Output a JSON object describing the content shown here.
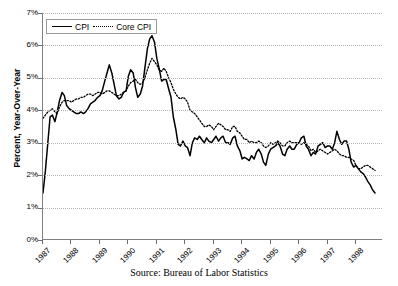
{
  "chart_data": {
    "type": "line",
    "title": "",
    "xlabel": "",
    "ylabel": "Percent, Year-Over-Year",
    "caption": "Source: Bureau of Labor Statistics",
    "ylim": [
      0,
      7
    ],
    "ytick_labels": [
      "0%",
      "1%",
      "2%",
      "3%",
      "4%",
      "5%",
      "6%",
      "7%"
    ],
    "ytick_values": [
      0,
      1,
      2,
      3,
      4,
      5,
      6,
      7
    ],
    "xtick_labels": [
      "1987",
      "1988",
      "1989",
      "1990",
      "1991",
      "1992",
      "1993",
      "1994",
      "1995",
      "1996",
      "1997",
      "1998"
    ],
    "xlim": [
      1987.0,
      1998.95
    ],
    "grid": "horizontal-dotted",
    "legend_position": "top-left-inside",
    "series": [
      {
        "name": "CPI",
        "style": "solid",
        "color": "#000000",
        "x": [
          1987.0,
          1987.08,
          1987.17,
          1987.25,
          1987.33,
          1987.42,
          1987.5,
          1987.58,
          1987.67,
          1987.75,
          1987.83,
          1987.92,
          1988.0,
          1988.08,
          1988.17,
          1988.25,
          1988.33,
          1988.42,
          1988.5,
          1988.58,
          1988.67,
          1988.75,
          1988.83,
          1988.92,
          1989.0,
          1989.08,
          1989.17,
          1989.25,
          1989.33,
          1989.42,
          1989.5,
          1989.58,
          1989.67,
          1989.75,
          1989.83,
          1989.92,
          1990.0,
          1990.08,
          1990.17,
          1990.25,
          1990.33,
          1990.42,
          1990.5,
          1990.58,
          1990.67,
          1990.75,
          1990.83,
          1990.92,
          1991.0,
          1991.08,
          1991.17,
          1991.25,
          1991.33,
          1991.42,
          1991.5,
          1991.58,
          1991.67,
          1991.75,
          1991.83,
          1991.92,
          1992.0,
          1992.08,
          1992.17,
          1992.25,
          1992.33,
          1992.42,
          1992.5,
          1992.58,
          1992.67,
          1992.75,
          1992.83,
          1992.92,
          1993.0,
          1993.08,
          1993.17,
          1993.25,
          1993.33,
          1993.42,
          1993.5,
          1993.58,
          1993.67,
          1993.75,
          1993.83,
          1993.92,
          1994.0,
          1994.08,
          1994.17,
          1994.25,
          1994.33,
          1994.42,
          1994.5,
          1994.58,
          1994.67,
          1994.75,
          1994.83,
          1994.92,
          1995.0,
          1995.08,
          1995.17,
          1995.25,
          1995.33,
          1995.42,
          1995.5,
          1995.58,
          1995.67,
          1995.75,
          1995.83,
          1995.92,
          1996.0,
          1996.08,
          1996.17,
          1996.25,
          1996.33,
          1996.42,
          1996.5,
          1996.58,
          1996.67,
          1996.75,
          1996.83,
          1996.92,
          1997.0,
          1997.08,
          1997.17,
          1997.25,
          1997.33,
          1997.42,
          1997.5,
          1997.58,
          1997.67,
          1997.75,
          1997.83,
          1997.92,
          1998.0,
          1998.08,
          1998.17,
          1998.25,
          1998.33,
          1998.42,
          1998.5,
          1998.58,
          1998.67
        ],
        "values": [
          1.45,
          2.1,
          3.0,
          3.8,
          3.85,
          3.65,
          3.95,
          4.3,
          4.55,
          4.45,
          4.15,
          4.05,
          4.0,
          3.95,
          3.9,
          3.9,
          3.95,
          3.9,
          3.95,
          4.05,
          4.2,
          4.25,
          4.3,
          4.4,
          4.45,
          4.6,
          4.9,
          5.15,
          5.4,
          5.15,
          4.8,
          4.45,
          4.35,
          4.4,
          4.55,
          4.6,
          5.05,
          5.25,
          5.15,
          4.7,
          4.4,
          4.5,
          4.75,
          5.3,
          5.9,
          6.2,
          6.3,
          6.1,
          5.6,
          5.3,
          4.9,
          4.95,
          4.95,
          4.65,
          4.4,
          3.8,
          3.4,
          2.95,
          2.9,
          3.05,
          2.9,
          2.85,
          2.6,
          3.0,
          3.15,
          3.1,
          3.2,
          3.1,
          3.0,
          3.15,
          3.05,
          3.0,
          3.1,
          3.2,
          3.05,
          3.15,
          3.2,
          3.0,
          3.0,
          2.95,
          3.15,
          3.2,
          2.9,
          2.75,
          2.5,
          2.55,
          2.5,
          2.45,
          2.6,
          2.5,
          2.7,
          2.8,
          2.65,
          2.4,
          2.3,
          2.65,
          2.8,
          2.85,
          2.9,
          3.0,
          2.9,
          2.65,
          2.6,
          2.8,
          2.9,
          2.8,
          2.8,
          2.95,
          3.0,
          3.15,
          3.2,
          2.9,
          2.8,
          2.6,
          2.7,
          2.65,
          2.9,
          2.95,
          3.0,
          2.85,
          2.9,
          2.9,
          2.8,
          3.0,
          3.35,
          3.1,
          2.95,
          3.05,
          3.05,
          2.8,
          2.4,
          2.25,
          2.3,
          2.2,
          2.1,
          2.05,
          1.95,
          1.8,
          1.7,
          1.55,
          1.45
        ]
      },
      {
        "name": "Core CPI",
        "style": "dotted",
        "color": "#000000",
        "x": [
          1987.0,
          1987.08,
          1987.17,
          1987.25,
          1987.33,
          1987.42,
          1987.5,
          1987.58,
          1987.67,
          1987.75,
          1987.83,
          1987.92,
          1988.0,
          1988.08,
          1988.17,
          1988.25,
          1988.33,
          1988.42,
          1988.5,
          1988.58,
          1988.67,
          1988.75,
          1988.83,
          1988.92,
          1989.0,
          1989.08,
          1989.17,
          1989.25,
          1989.33,
          1989.42,
          1989.5,
          1989.58,
          1989.67,
          1989.75,
          1989.83,
          1989.92,
          1990.0,
          1990.08,
          1990.17,
          1990.25,
          1990.33,
          1990.42,
          1990.5,
          1990.58,
          1990.67,
          1990.75,
          1990.83,
          1990.92,
          1991.0,
          1991.08,
          1991.17,
          1991.25,
          1991.33,
          1991.42,
          1991.5,
          1991.58,
          1991.67,
          1991.75,
          1991.83,
          1991.92,
          1992.0,
          1992.08,
          1992.17,
          1992.25,
          1992.33,
          1992.42,
          1992.5,
          1992.58,
          1992.67,
          1992.75,
          1992.83,
          1992.92,
          1993.0,
          1993.08,
          1993.17,
          1993.25,
          1993.33,
          1993.42,
          1993.5,
          1993.58,
          1993.67,
          1993.75,
          1993.83,
          1993.92,
          1994.0,
          1994.08,
          1994.17,
          1994.25,
          1994.33,
          1994.42,
          1994.5,
          1994.58,
          1994.67,
          1994.75,
          1994.83,
          1994.92,
          1995.0,
          1995.08,
          1995.17,
          1995.25,
          1995.33,
          1995.42,
          1995.5,
          1995.58,
          1995.67,
          1995.75,
          1995.83,
          1995.92,
          1996.0,
          1996.08,
          1996.17,
          1996.25,
          1996.33,
          1996.42,
          1996.5,
          1996.58,
          1996.67,
          1996.75,
          1996.83,
          1996.92,
          1997.0,
          1997.08,
          1997.17,
          1997.25,
          1997.33,
          1997.42,
          1997.5,
          1997.58,
          1997.67,
          1997.75,
          1997.83,
          1997.92,
          1998.0,
          1998.08,
          1998.17,
          1998.25,
          1998.33,
          1998.42,
          1998.5,
          1998.58,
          1998.67
        ],
        "values": [
          3.75,
          3.85,
          3.95,
          4.0,
          4.05,
          3.95,
          3.9,
          4.1,
          4.25,
          4.3,
          4.3,
          4.3,
          4.25,
          4.3,
          4.35,
          4.35,
          4.4,
          4.4,
          4.45,
          4.5,
          4.5,
          4.45,
          4.5,
          4.55,
          4.55,
          4.5,
          4.55,
          4.6,
          4.6,
          4.55,
          4.5,
          4.45,
          4.45,
          4.5,
          4.55,
          4.6,
          4.75,
          4.85,
          4.9,
          4.95,
          4.85,
          4.8,
          4.85,
          5.0,
          5.25,
          5.45,
          5.6,
          5.5,
          5.4,
          5.25,
          5.2,
          5.3,
          5.2,
          5.0,
          4.85,
          4.65,
          4.5,
          4.4,
          4.35,
          4.4,
          4.35,
          4.25,
          4.0,
          3.95,
          3.9,
          3.8,
          3.7,
          3.6,
          3.5,
          3.5,
          3.55,
          3.5,
          3.4,
          3.5,
          3.6,
          3.55,
          3.5,
          3.4,
          3.4,
          3.35,
          3.5,
          3.5,
          3.35,
          3.3,
          3.2,
          3.1,
          3.1,
          3.0,
          3.05,
          3.0,
          3.0,
          3.05,
          3.0,
          2.9,
          2.85,
          2.9,
          3.0,
          2.95,
          3.0,
          3.05,
          3.0,
          2.9,
          2.9,
          3.0,
          3.05,
          3.0,
          3.0,
          3.0,
          3.0,
          2.95,
          3.0,
          2.95,
          2.9,
          2.75,
          2.8,
          2.7,
          2.75,
          2.8,
          2.75,
          2.7,
          2.65,
          2.7,
          2.75,
          2.8,
          2.75,
          2.65,
          2.6,
          2.6,
          2.55,
          2.55,
          2.5,
          2.45,
          2.3,
          2.2,
          2.2,
          2.25,
          2.3,
          2.3,
          2.25,
          2.2,
          2.15
        ]
      }
    ]
  },
  "legend": {
    "items": [
      {
        "label": "CPI",
        "style": "solid"
      },
      {
        "label": "Core CPI",
        "style": "dotted"
      }
    ]
  },
  "axes": {
    "y_title": "Percent, Year-Over-Year"
  },
  "caption": {
    "text": "Source: Bureau of Labor Statistics"
  }
}
